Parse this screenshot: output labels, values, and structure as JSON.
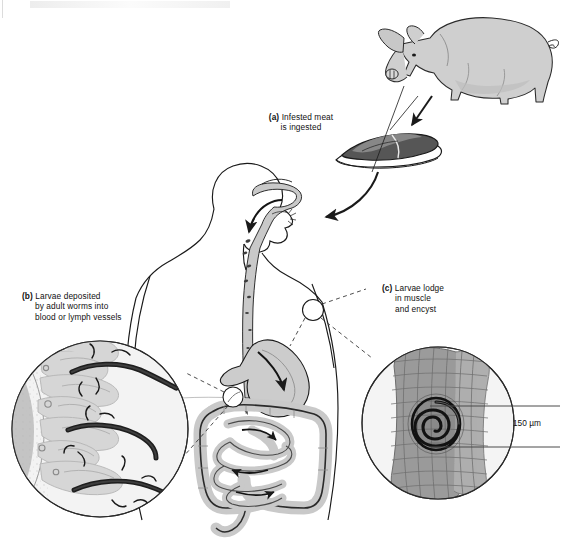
{
  "figure": {
    "title_visible": false,
    "background": "#ffffff",
    "width": 564,
    "height": 542,
    "labels": {
      "a": {
        "marker": "(a)",
        "line1": "Infested meat",
        "line2": "is ingested"
      },
      "b": {
        "marker": "(b)",
        "line1": "Larvae deposited",
        "line2": "by adult worms into",
        "line3": "blood or lymph vessels"
      },
      "c": {
        "marker": "(c)",
        "line1": "Larvae lodge",
        "line2": "in muscle",
        "line3": "and encyst"
      }
    },
    "scale_bar": {
      "value": "150",
      "unit": "µm",
      "text": "150 µm"
    },
    "elements": {
      "pig": "pig-illustration",
      "meat": "pork-steak-illustration",
      "human": "human-torso-profile",
      "esophagus": "esophagus",
      "stomach": "stomach",
      "small_intestine": "small-intestine",
      "large_intestine": "large-intestine",
      "inset_b": "intestinal-villi-with-adult-worms",
      "inset_c": "striated-muscle-with-encysted-larva",
      "marker_intestine": "callout-circle-intestine",
      "marker_shoulder": "callout-circle-muscle",
      "arrow_meat_to_mouth": "ingestion-arrow"
    },
    "colors": {
      "outline": "#1a1a1a",
      "tissue_fill": "#d3d3d3",
      "tissue_light": "#e3e3e3",
      "muscle_fill": "#9a9a9a",
      "worm_dark": "#2b2b2b",
      "pig_fill": "#cfcfcf",
      "meat_dark": "#555555",
      "dashed": "#3a3a3a",
      "inset_bg": "#f2f2f2"
    }
  }
}
